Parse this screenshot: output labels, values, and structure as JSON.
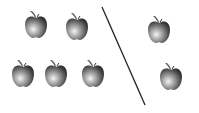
{
  "scene": {
    "description": "Apples separated by a diagonal line",
    "colors": {
      "background": "#ffffff",
      "apple_dark": "#2a2a2a",
      "apple_mid": "#7a7a7a",
      "apple_light": "#f0f0f0",
      "line": "#222222"
    },
    "left_group": {
      "count": 5,
      "apples": [
        {
          "cx": 36,
          "cy": 26
        },
        {
          "cx": 77,
          "cy": 28
        },
        {
          "cx": 23,
          "cy": 75
        },
        {
          "cx": 56,
          "cy": 75
        },
        {
          "cx": 93,
          "cy": 75
        }
      ]
    },
    "divider": {
      "x1": 102,
      "y1": 7,
      "x2": 145,
      "y2": 105
    },
    "right_group": {
      "count": 2,
      "apples": [
        {
          "cx": 159,
          "cy": 31
        },
        {
          "cx": 171,
          "cy": 78
        }
      ]
    }
  }
}
